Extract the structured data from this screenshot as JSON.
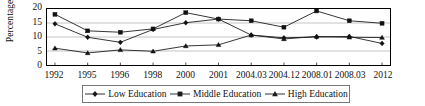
{
  "chart_data": {
    "type": "line",
    "title": "",
    "xlabel": "",
    "ylabel": "Percentages",
    "ylim": [
      0,
      20
    ],
    "yticks": [
      0,
      5,
      10,
      15,
      20
    ],
    "grid": true,
    "legend_position": "bottom",
    "categories": [
      "1992",
      "1995",
      "1996",
      "1998",
      "2000",
      "2001",
      "2004.03",
      "2004.12",
      "2008.01",
      "2008.03",
      "2012"
    ],
    "series": [
      {
        "name": "Low Education",
        "marker": "diamond",
        "values": [
          14.7,
          9.9,
          8.1,
          12.7,
          15.1,
          16.4,
          10.7,
          9.7,
          10.0,
          10.2,
          7.7
        ]
      },
      {
        "name": "Middle Education",
        "marker": "square",
        "values": [
          18.1,
          12.2,
          11.7,
          12.9,
          18.7,
          16.4,
          15.8,
          13.5,
          19.3,
          15.8,
          14.9
        ]
      },
      {
        "name": "High Education",
        "marker": "triangle",
        "values": [
          6.0,
          4.3,
          5.4,
          4.9,
          6.8,
          7.2,
          10.7,
          9.3,
          10.2,
          9.9,
          9.8
        ]
      }
    ]
  },
  "axis": {
    "y_label": "Percentages",
    "y_ticks": [
      "20",
      "15",
      "10",
      "5",
      "0"
    ],
    "x_ticks": [
      "1992",
      "1995",
      "1996",
      "1998",
      "2000",
      "2001",
      "2004.03",
      "2004.12",
      "2008.01",
      "2008.03",
      "2012"
    ]
  },
  "legend": {
    "items": [
      {
        "label": "Low Education",
        "marker": "diamond-marker-icon"
      },
      {
        "label": "Middle Education",
        "marker": "square-marker-icon"
      },
      {
        "label": "High Education",
        "marker": "triangle-marker-icon"
      }
    ]
  },
  "colors": {
    "line": "#1a1a1a",
    "grid": "#9a9a9a",
    "frame": "#000000",
    "background": "#ffffff"
  }
}
